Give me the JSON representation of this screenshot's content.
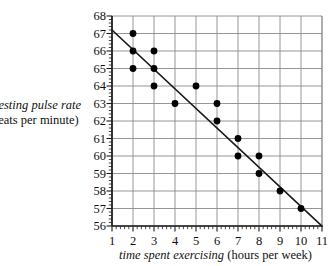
{
  "chart_data": {
    "type": "scatter",
    "title": "",
    "xlabel_italic": "time spent exercising",
    "xlabel_roman": " (hours per week)",
    "ylabel_line1": "resting pulse rate",
    "ylabel_line2": "beats per minute)",
    "xlim": [
      1,
      11
    ],
    "ylim": [
      56,
      68
    ],
    "x_ticks": [
      1,
      2,
      3,
      4,
      5,
      6,
      7,
      8,
      9,
      10,
      11
    ],
    "y_ticks": [
      56,
      57,
      58,
      59,
      60,
      61,
      62,
      63,
      64,
      65,
      66,
      67,
      68
    ],
    "x_minor_per_major": 5,
    "y_minor_per_major": 5,
    "grid": true,
    "grid_color": "#8a8a8a",
    "axis_color": "#1a1a1a",
    "point_color": "#000000",
    "point_radius": 3.4,
    "legend": "none",
    "points": [
      {
        "x": 2,
        "y": 67
      },
      {
        "x": 2,
        "y": 66
      },
      {
        "x": 2,
        "y": 65
      },
      {
        "x": 3,
        "y": 66
      },
      {
        "x": 3,
        "y": 65
      },
      {
        "x": 3,
        "y": 64
      },
      {
        "x": 4,
        "y": 63
      },
      {
        "x": 5,
        "y": 64
      },
      {
        "x": 6,
        "y": 63
      },
      {
        "x": 6,
        "y": 62
      },
      {
        "x": 7,
        "y": 61
      },
      {
        "x": 7,
        "y": 60
      },
      {
        "x": 8,
        "y": 60
      },
      {
        "x": 8,
        "y": 59
      },
      {
        "x": 9,
        "y": 58
      },
      {
        "x": 10,
        "y": 57
      }
    ],
    "trend_line": {
      "name": "line of best fit",
      "x1": 1,
      "y1": 67.2,
      "x2": 11,
      "y2": 56.0,
      "color": "#1a1a1a",
      "width": 1.6
    }
  }
}
